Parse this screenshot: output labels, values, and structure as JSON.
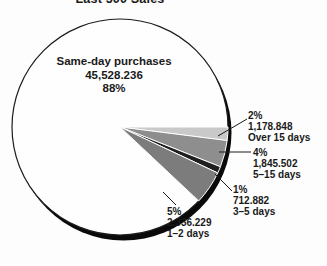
{
  "title": "Last 500 Sales",
  "main_label": {
    "name": "Same-day purchases",
    "value": "45,528.236",
    "pct": "88%"
  },
  "callouts": [
    {
      "pct": "2%",
      "value": "1,178.848",
      "label": "Over 15 days"
    },
    {
      "pct": "4%",
      "value": "1,845.502",
      "label": "5–15 days"
    },
    {
      "pct": "1%",
      "value": "712.882",
      "label": "3–5 days"
    },
    {
      "pct": "5%",
      "value": "2,336.229",
      "label": "1–2 days"
    }
  ],
  "chart_data": {
    "type": "pie",
    "title": "Last 500 Sales",
    "legend_position": "none",
    "labels_style": "callouts-with-leader-lines",
    "slices": [
      {
        "label": "Same-day purchases",
        "value": 45528.236,
        "value_text": "45,528.236",
        "pct": 88,
        "color": "#fefefe"
      },
      {
        "label": "Over 15 days",
        "value": 1178.848,
        "value_text": "1,178.848",
        "pct": 2,
        "color": "#c9c9c9"
      },
      {
        "label": "5–15 days",
        "value": 1845.502,
        "value_text": "1,845.502",
        "pct": 4,
        "color": "#8e8e8e"
      },
      {
        "label": "3–5 days",
        "value": 712.882,
        "value_text": "712.882",
        "pct": 1,
        "color": "#1f1f1f"
      },
      {
        "label": "1–2 days",
        "value": 2336.229,
        "value_text": "2,336.229",
        "pct": 5,
        "color": "#7c7c7c"
      }
    ],
    "style": {
      "shadow_color": "#0a0a0a",
      "outline_color": "#1c1c1c",
      "slice_separator_color": "#ffffff",
      "leader_line_color": "#1a1a1a",
      "start_angle_deg": 0,
      "direction": "clockwise"
    }
  }
}
